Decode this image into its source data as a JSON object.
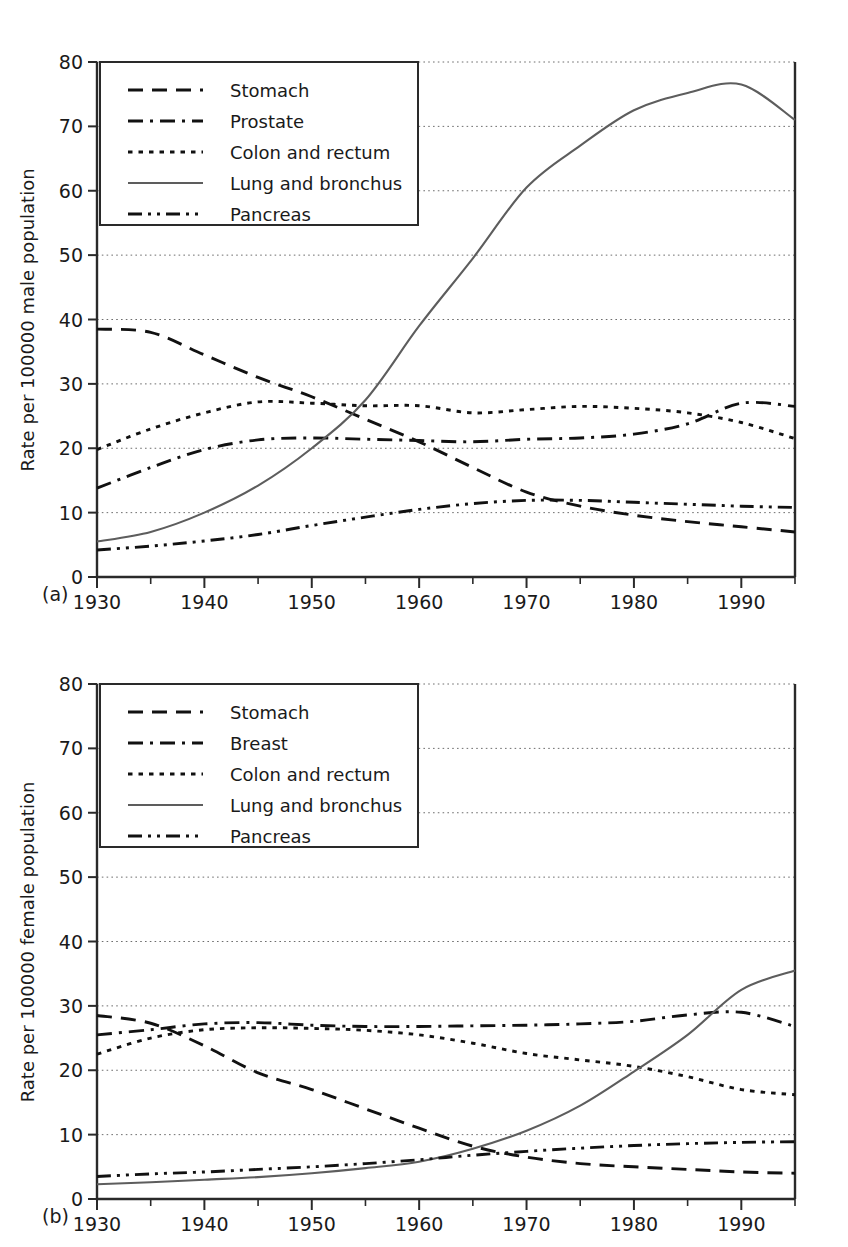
{
  "figure": {
    "panels": [
      {
        "letter": "(a)",
        "ylabel": "Rate per 100000 male population",
        "legend_labels": [
          "Stomach",
          "Prostate",
          "Colon and rectum",
          "Lung and bronchus",
          "Pancreas"
        ]
      },
      {
        "letter": "(b)",
        "ylabel": "Rate per 100000 female population",
        "legend_labels": [
          "Stomach",
          "Breast",
          "Colon and rectum",
          "Lung and bronchus",
          "Pancreas"
        ]
      }
    ],
    "yticks": [
      "0",
      "10",
      "20",
      "30",
      "40",
      "50",
      "60",
      "70",
      "80"
    ],
    "xticks": [
      "1930",
      "1940",
      "1950",
      "1960",
      "1970",
      "1980",
      "1990"
    ]
  },
  "chart_data": [
    {
      "type": "line",
      "panel": "(a)",
      "title": "",
      "xlabel": "",
      "ylabel": "Rate per 100000 male population",
      "xlim": [
        1930,
        1995
      ],
      "ylim": [
        0,
        80
      ],
      "grid": true,
      "legend_position": "upper-left",
      "x": [
        1930,
        1935,
        1940,
        1945,
        1950,
        1955,
        1960,
        1965,
        1970,
        1975,
        1980,
        1985,
        1990,
        1995
      ],
      "series": [
        {
          "name": "Stomach",
          "style": "dashed",
          "values": [
            38.5,
            38.0,
            34.5,
            31.0,
            28.0,
            24.5,
            21.0,
            17.0,
            13.2,
            11.0,
            9.6,
            8.6,
            7.8,
            7.0
          ]
        },
        {
          "name": "Prostate",
          "style": "dash-dot",
          "values": [
            13.8,
            17.0,
            19.8,
            21.3,
            21.6,
            21.4,
            21.2,
            21.0,
            21.4,
            21.6,
            22.2,
            23.8,
            27.0,
            26.5
          ]
        },
        {
          "name": "Colon and rectum",
          "style": "dotted",
          "values": [
            19.8,
            23.0,
            25.5,
            27.2,
            27.0,
            26.6,
            26.6,
            25.5,
            26.0,
            26.5,
            26.2,
            25.5,
            24.0,
            21.5
          ]
        },
        {
          "name": "Lung and bronchus",
          "style": "solid",
          "values": [
            5.5,
            7.0,
            10.0,
            14.2,
            20.0,
            27.5,
            39.0,
            49.5,
            60.5,
            67.0,
            72.5,
            75.2,
            76.5,
            71.0
          ]
        },
        {
          "name": "Pancreas",
          "style": "dash-dot-dot",
          "values": [
            4.2,
            4.8,
            5.6,
            6.6,
            8.0,
            9.3,
            10.5,
            11.4,
            11.9,
            11.9,
            11.6,
            11.3,
            11.0,
            10.8
          ]
        }
      ]
    },
    {
      "type": "line",
      "panel": "(b)",
      "title": "",
      "xlabel": "",
      "ylabel": "Rate per 100000 female population",
      "xlim": [
        1930,
        1995
      ],
      "ylim": [
        0,
        80
      ],
      "grid": true,
      "legend_position": "upper-left",
      "x": [
        1930,
        1935,
        1940,
        1945,
        1950,
        1955,
        1960,
        1965,
        1970,
        1975,
        1980,
        1985,
        1990,
        1995
      ],
      "series": [
        {
          "name": "Stomach",
          "style": "dashed",
          "values": [
            28.5,
            27.3,
            23.8,
            19.6,
            17.0,
            14.0,
            11.0,
            8.2,
            6.5,
            5.5,
            5.0,
            4.6,
            4.2,
            4.0
          ]
        },
        {
          "name": "Breast",
          "style": "dash-dot",
          "values": [
            25.5,
            26.3,
            27.2,
            27.4,
            27.0,
            26.8,
            26.8,
            26.9,
            27.0,
            27.2,
            27.6,
            28.6,
            29.0,
            26.8
          ]
        },
        {
          "name": "Colon and rectum",
          "style": "dotted",
          "values": [
            22.5,
            25.0,
            26.3,
            26.6,
            26.5,
            26.2,
            25.5,
            24.2,
            22.6,
            21.6,
            20.6,
            19.0,
            17.0,
            16.2
          ]
        },
        {
          "name": "Lung and bronchus",
          "style": "solid",
          "values": [
            2.3,
            2.6,
            3.0,
            3.4,
            4.0,
            4.8,
            5.8,
            7.8,
            10.6,
            14.5,
            19.8,
            25.5,
            32.5,
            35.5
          ]
        },
        {
          "name": "Pancreas",
          "style": "dash-dot-dot",
          "values": [
            3.5,
            3.9,
            4.2,
            4.6,
            5.0,
            5.5,
            6.1,
            6.8,
            7.4,
            7.9,
            8.3,
            8.6,
            8.8,
            8.9
          ]
        }
      ]
    }
  ]
}
